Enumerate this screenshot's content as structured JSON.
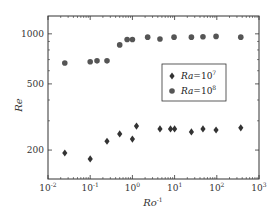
{
  "chart_data": {
    "type": "scatter",
    "title": "",
    "xlabel": "Ro",
    "xlabel_sup": "-1",
    "ylabel": "Re",
    "xscale": "log",
    "yscale": "log",
    "xlim": [
      0.01,
      1000
    ],
    "ylim": [
      134,
      1280
    ],
    "xticks": [
      {
        "value": 0.01,
        "base": "10",
        "exp": "-2"
      },
      {
        "value": 0.1,
        "base": "10",
        "exp": "-1"
      },
      {
        "value": 1,
        "base": "10",
        "exp": "0"
      },
      {
        "value": 10,
        "base": "10",
        "exp": "1"
      },
      {
        "value": 100,
        "base": "10",
        "exp": "2"
      },
      {
        "value": 1000,
        "base": "10",
        "exp": "3"
      }
    ],
    "yticks": [
      {
        "value": 200,
        "label": "200"
      },
      {
        "value": 500,
        "label": "500"
      },
      {
        "value": 1000,
        "label": "1000"
      }
    ],
    "grid": false,
    "legend_position": "center-right",
    "series": [
      {
        "name": "Ra=10^7",
        "label_base": "Ra",
        "label_eq": "=10",
        "label_exp": "7",
        "marker": "diamond",
        "color": "#333333",
        "points": [
          {
            "x": 0.025,
            "y": 192
          },
          {
            "x": 0.1,
            "y": 177
          },
          {
            "x": 0.25,
            "y": 226
          },
          {
            "x": 0.5,
            "y": 250
          },
          {
            "x": 1.0,
            "y": 233
          },
          {
            "x": 1.25,
            "y": 279
          },
          {
            "x": 4.5,
            "y": 268
          },
          {
            "x": 8,
            "y": 268
          },
          {
            "x": 10,
            "y": 268
          },
          {
            "x": 25,
            "y": 257
          },
          {
            "x": 47,
            "y": 268
          },
          {
            "x": 96,
            "y": 264
          },
          {
            "x": 370,
            "y": 272
          }
        ]
      },
      {
        "name": "Ra=10^8",
        "label_base": "Ra",
        "label_eq": "=10",
        "label_exp": "8",
        "marker": "circle",
        "color": "#555555",
        "points": [
          {
            "x": 0.025,
            "y": 668
          },
          {
            "x": 0.1,
            "y": 680
          },
          {
            "x": 0.145,
            "y": 688
          },
          {
            "x": 0.25,
            "y": 688
          },
          {
            "x": 0.5,
            "y": 858
          },
          {
            "x": 0.75,
            "y": 925
          },
          {
            "x": 1.0,
            "y": 925
          },
          {
            "x": 2.3,
            "y": 955
          },
          {
            "x": 4.5,
            "y": 930
          },
          {
            "x": 9.7,
            "y": 955
          },
          {
            "x": 25,
            "y": 955
          },
          {
            "x": 47,
            "y": 960
          },
          {
            "x": 96,
            "y": 965
          },
          {
            "x": 370,
            "y": 955
          }
        ]
      }
    ]
  }
}
